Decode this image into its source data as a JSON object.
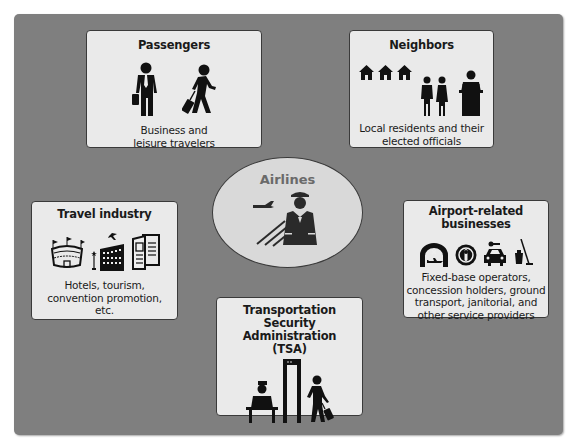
{
  "diagram": {
    "center": {
      "label": "Airlines",
      "icon": "pilot-airplane-icon"
    },
    "stakeholders": [
      {
        "id": "passengers",
        "title": "Passengers",
        "description_lines": [
          "Business and",
          "leisure travelers"
        ],
        "icons": [
          "businessman-icon",
          "traveler-with-luggage-icon"
        ]
      },
      {
        "id": "neighbors",
        "title": "Neighbors",
        "description_lines": [
          "Local residents and their",
          "elected officials"
        ],
        "icons": [
          "house-icon",
          "house-icon",
          "house-icon",
          "couple-icon",
          "official-at-podium-icon"
        ]
      },
      {
        "id": "travel-industry",
        "title": "Travel industry",
        "description_lines": [
          "Hotels, tourism,",
          "convention promotion,",
          "etc."
        ],
        "icons": [
          "stadium-icon",
          "hotel-icon",
          "brochure-icon"
        ]
      },
      {
        "id": "airport-businesses",
        "title_lines": [
          "Airport-related",
          "businesses"
        ],
        "description_lines": [
          "Fixed-base operators,",
          "concession holders, ground",
          "transport, janitorial, and",
          "other service providers"
        ],
        "icons": [
          "hangar-icon",
          "concession-icon",
          "taxi-icon",
          "janitorial-icon"
        ]
      },
      {
        "id": "tsa",
        "title_lines": [
          "Transportation",
          "Security Administration",
          "(TSA)"
        ],
        "icons": [
          "security-officer-icon",
          "metal-detector-icon",
          "traveler-with-luggage-icon"
        ]
      }
    ]
  },
  "colors": {
    "panel": "#7f7f7f",
    "box": "#eaeaea",
    "oval": "#d9d9d9",
    "icon": "#111111",
    "center_label": "#6a6a6a"
  }
}
